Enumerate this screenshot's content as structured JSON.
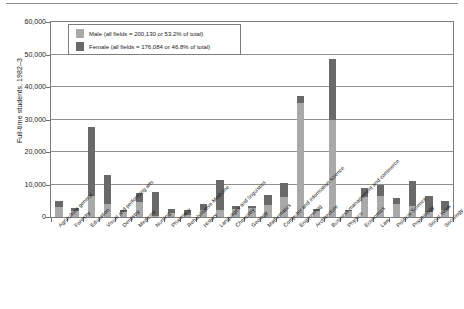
{
  "chart_data": {
    "type": "bar",
    "stacked": true,
    "title": "",
    "subtitle": "",
    "xlabel": "",
    "ylabel": "Full-time students, 1982–3",
    "ylim": [
      0,
      60000
    ],
    "ytick_labels": [
      "60,000",
      "50,000",
      "40,000",
      "30,000",
      "20,000",
      "10,000",
      "0"
    ],
    "ytick_values": [
      60000,
      50000,
      40000,
      30000,
      20000,
      10000,
      0
    ],
    "grid": true,
    "legend_position": "upper-left-inside",
    "categories": [
      "Agriculture general",
      "Forestry",
      "Education",
      "Visual and performing arts",
      "Dentistry",
      "Medicine",
      "Nursing",
      "Pharmacy",
      "Rehabilitative Medicine",
      "History",
      "Languages and linguistics",
      "Chemistry",
      "Geology",
      "Mathematics",
      "Computer and information science",
      "Engineering",
      "Architecture",
      "Business management and commerce",
      "Physics",
      "Economics",
      "Law",
      "Political Science",
      "Psychology",
      "Social Work",
      "Sociology"
    ],
    "series": [
      {
        "name": "Male",
        "color": "#a9a9a9",
        "values": [
          3100,
          1900,
          6600,
          4000,
          1500,
          4600,
          400,
          1100,
          600,
          2300,
          2100,
          2400,
          2700,
          3600,
          6200,
          35000,
          1700,
          30000,
          1900,
          6300,
          6400,
          4000,
          3500,
          1500,
          2200
        ]
      },
      {
        "name": "Female",
        "color": "#696969",
        "values": [
          1800,
          1000,
          21200,
          8900,
          800,
          2800,
          7200,
          1300,
          1700,
          1700,
          9300,
          1000,
          600,
          3300,
          4300,
          2100,
          700,
          18500,
          400,
          2500,
          3600,
          2000,
          7600,
          5000,
          2700
        ]
      }
    ],
    "legend": [
      {
        "label": "Male (all fields = 200,130 or 53.2% of total)",
        "color": "#a9a9a9",
        "total": "200,130",
        "percent": "53.2%"
      },
      {
        "label": "Female (all fields = 176,084 or 46.8% of total)",
        "color": "#696969",
        "total": "176,084",
        "percent": "46.8%"
      }
    ]
  }
}
